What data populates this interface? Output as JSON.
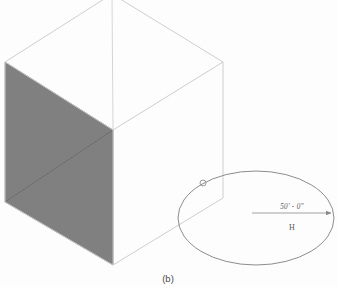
{
  "figure": {
    "caption": "(b)",
    "background_color": "#fdfdfd"
  },
  "cube": {
    "name": "isometric-cube",
    "edge_color": "#c9c9c9",
    "shaded_face_color": "#808080",
    "shaded_face_edge_color": "#6e6e6e",
    "vertices": {
      "top": "112,-6",
      "left": "5,62",
      "right": "223,62",
      "center": "113,130",
      "bottom": "113,265",
      "left_bottom": "5,202",
      "right_bottom": "223,198"
    }
  },
  "ellipse": {
    "name": "radius-ellipse",
    "stroke_color": "#8d8d8d",
    "center_x": 256,
    "center_y": 218,
    "radius_x": 78,
    "radius_y": 47
  },
  "marker": {
    "name": "intersection-point",
    "x": 203,
    "y": 183,
    "radius": 3,
    "stroke_color": "#9a9a9a"
  },
  "dimension": {
    "label": "50' - 0\"",
    "tick_glyph": "H",
    "line_color": "#8a8a8a",
    "text_color": "#5a5a5a",
    "start_x": 252,
    "start_y": 213,
    "end_x": 333,
    "end_y": 213,
    "label_x": 292,
    "label_y": 208,
    "tick_x": 292,
    "tick_y": 227
  }
}
